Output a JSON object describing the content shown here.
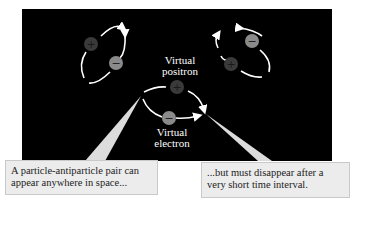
{
  "diagram": {
    "labels": {
      "positron": "Virtual\npositron",
      "positron_line1": "Virtual",
      "positron_line2": "positron",
      "electron_line1": "Virtual",
      "electron_line2": "electron"
    },
    "particles": {
      "positive_symbol": "+",
      "negative_symbol": "−"
    },
    "callouts": [
      {
        "line1": "A particle-antiparticle pair can",
        "line2": "appear anywhere in space..."
      },
      {
        "line1": "...but must disappear after a",
        "line2": "very short time interval."
      }
    ],
    "colors": {
      "background": "#000000",
      "loop": "#ffffff",
      "positron_fill": "#3a3a3a",
      "electron_fill": "#8a8a8a",
      "callout_fill": "#ececec",
      "pointer": "#dcdcdc"
    }
  }
}
